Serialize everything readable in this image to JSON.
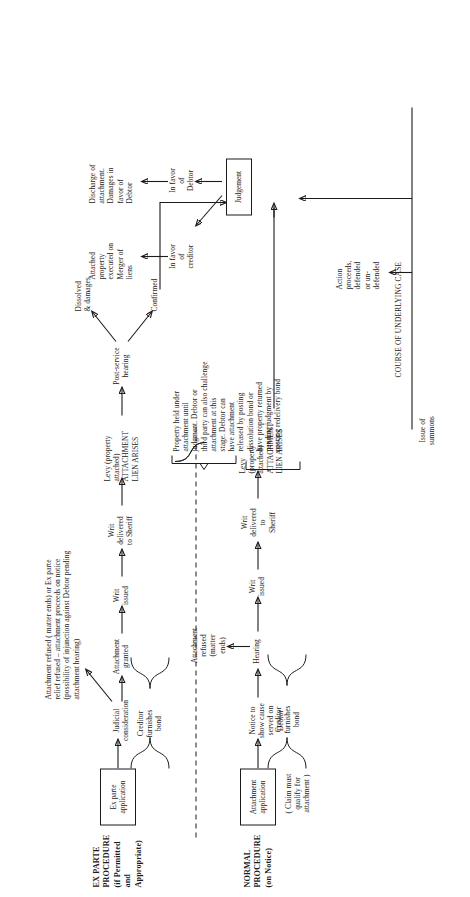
{
  "diagram": {
    "title_course": "COURSE OF UNDERLYING CASE",
    "lanes": {
      "ex_parte": "EX PARTE\nPROCEDURE\n(if Permitted\nand Appropriate)",
      "normal": "NORMAL\nPROCEDURE\n(on Notice)"
    },
    "boxes": {
      "ex_parte_application": "Ex parte\napplication",
      "attachment_application": "Attachment\napplication",
      "judgement": "Judgement"
    },
    "ex_parte_path": {
      "judicial_consideration": "Judicial\nconsideration",
      "refusal_note": "Attachment refused ( matter ends) or Ex parte\nrelief refused – attachment proceeds on notice\n(possibility of injunction against Debtor pending\nattachment hearing)",
      "attachment_granted": "Attachment\ngranted",
      "creditor_bond": "Creditor\nfurnishes\nbond",
      "writ_issued": "Writ\nissued",
      "writ_delivered": "Writ\ndelivered\nto Sheriff",
      "levy": "Levy (property\nattached)\nATTACHMENT\nLIEN ARISES"
    },
    "normal_path": {
      "claim_note": "( Claim must\nqualify for\nattachment )",
      "notice_to_show_cause": "Notice to\nshow cause\nserved on\nDebtor",
      "creditor_bond": "Creditor\nfurnishes\nbond",
      "hearing": "Hearing",
      "attachment_refused": "Attachment\nrefused\n(matter\nends)",
      "writ_issued": "Writ\nissued",
      "writ_delivered": "Writ\ndelivered\nto\nSheriff",
      "levy": "Levy\n(property\nattached)\nATTACHMENT\nLIEN ARISES"
    },
    "post_levy": {
      "post_service_hearing": "Post-service\nhearing",
      "dissolved": "Dissolved\n& damages",
      "confirmed": "Confirmed",
      "property_held_note": "Property held under\nattachment until\njudgment. Debtor or\nthird party can also challenge\nattachment at this\nstage. Debtor can\nhave attachment\nreleased by posting\ndissolution bond or\nhave property returned\npending judgment by\nposting redelivery bond"
    },
    "underlying_case": {
      "issue_of_summons": "Issue of\nsummons",
      "action_proceeds": "Action\nproceeds,\ndefended\nor un-\ndefended"
    },
    "outcomes": {
      "in_favor_of_creditor": "In favor\nof\ncreditor",
      "creditor_result": "Attached\nproperty\nexecuted on\nMerger of\nliens",
      "in_favor_of_debtor": "In favor\nof\nDebtor",
      "debtor_result": "Discharge of\nattachment.\nDamages in\nfavor of\nDebtor"
    },
    "colors": {
      "ink": "#1b1b1b",
      "paper": "#ffffff"
    }
  }
}
